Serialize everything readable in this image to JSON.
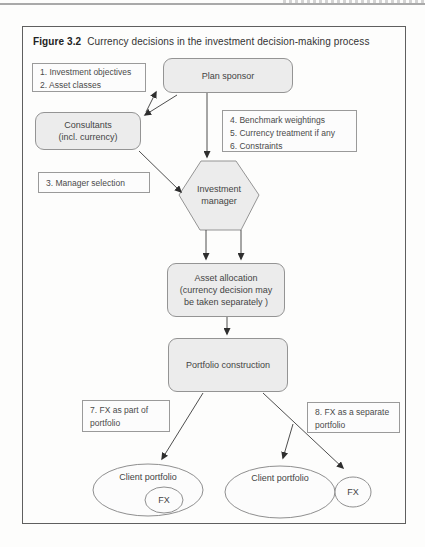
{
  "figure": {
    "label": "Figure 3.2",
    "caption": "Currency decisions in the investment decision-making process"
  },
  "nodes": {
    "annotation_1_2": {
      "lines": [
        "1. Investment objectives",
        "2. Asset classes"
      ]
    },
    "plan_sponsor": {
      "label": "Plan sponsor"
    },
    "consultants": {
      "lines": [
        "Consultants",
        "(incl. currency)"
      ]
    },
    "annotation_4_6": {
      "lines": [
        "4. Benchmark weightings",
        "5. Currency treatment if any",
        "6. Constraints"
      ]
    },
    "annotation_3": {
      "lines": [
        "3. Manager selection"
      ]
    },
    "investment_manager": {
      "lines": [
        "Investment",
        "manager"
      ]
    },
    "asset_allocation": {
      "lines": [
        "Asset allocation",
        "(currency decision may",
        "be taken separately )"
      ]
    },
    "portfolio_construction": {
      "label": "Portfolio construction"
    },
    "annotation_7": {
      "lines": [
        "7. FX as part of",
        "portfolio"
      ]
    },
    "annotation_8": {
      "lines": [
        "8. FX as a separate",
        "portfolio"
      ]
    },
    "client_portfolio_left": {
      "label": "Client portfolio"
    },
    "fx_left": {
      "label": "FX"
    },
    "client_portfolio_right": {
      "label": "Client portfolio"
    },
    "fx_right": {
      "label": "FX"
    }
  },
  "colors": {
    "frame_border": "#5f5f5f",
    "box_border": "#949494",
    "box_fill": "#ececec",
    "text": "#3d3d3d",
    "arrow": "#3a3a3a",
    "page_rule": "#a9a9a9"
  }
}
